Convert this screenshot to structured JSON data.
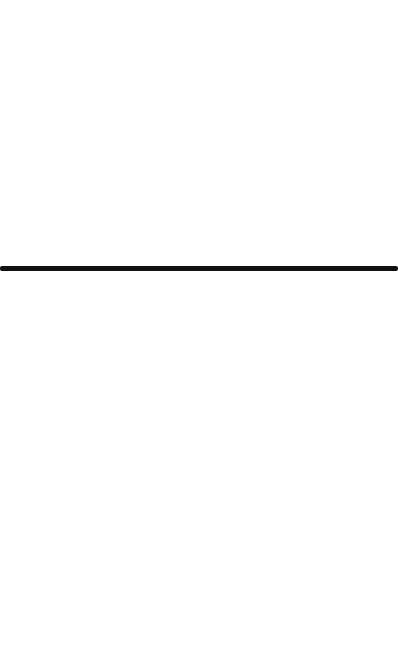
{
  "canvas": {
    "background": "#ffffff"
  },
  "divider": {
    "color": "#111111",
    "thickness_px": 5,
    "top_px": 266
  }
}
